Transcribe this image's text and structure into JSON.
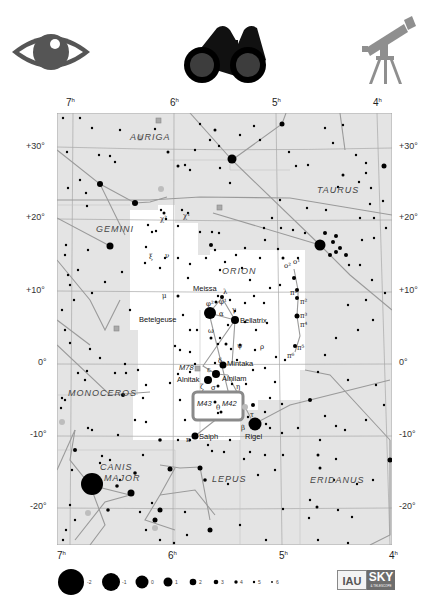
{
  "icons": {
    "eye": "eye-icon",
    "binoculars": "binoculars-icon",
    "telescope": "telescope-icon"
  },
  "ra_labels": [
    "7",
    "6",
    "5",
    "4"
  ],
  "ra_unit": "h",
  "dec_labels": [
    "+30°",
    "+20°",
    "+10°",
    "0°",
    "-10°",
    "-20°"
  ],
  "constellations": [
    "AURIGA",
    "TAURUS",
    "GEMINI",
    "ORION",
    "MONOCEROS",
    "CANIS",
    "MAJOR",
    "LEPUS",
    "ERIDANUS"
  ],
  "stars": {
    "betelgeuse": "Betelgeuse",
    "bellatrix": "Bellatrix",
    "meissa": "Meissa",
    "mintaka": "Mintaka",
    "alnitak": "Alnitak",
    "alnilam": "Alnilam",
    "saiph": "Saiph",
    "rigel": "Rigel"
  },
  "greek": {
    "alpha": "α",
    "gamma": "γ",
    "lambda": "λ",
    "phi1": "φ¹",
    "phi2": "φ²",
    "omega": "ω",
    "psi": "ψ",
    "rho": "ρ",
    "delta": "δ",
    "epsilon": "ε",
    "zeta": "ζ",
    "sigma": "σ",
    "iota": "ι",
    "eta": "η",
    "theta": "θ",
    "kappa": "κ",
    "beta": "β",
    "tau": "τ",
    "mu": "μ",
    "nu": "ν",
    "xi": "ξ",
    "chi1": "χ¹",
    "chi2": "χ²",
    "o1": "o¹",
    "o2": "o²",
    "pi1": "π¹",
    "pi2": "π²",
    "pi3": "π³",
    "pi4": "π⁴",
    "pi5": "π⁵",
    "pi6": "π⁶"
  },
  "deep_sky": {
    "m42": "M42",
    "m43": "M43",
    "m78": "M78"
  },
  "magnitude_legend": [
    "-2",
    "-1",
    "0",
    "1",
    "2",
    "3",
    "4",
    "5",
    "6"
  ],
  "logos": {
    "iau": "IAU",
    "sky": "SKY",
    "sky_sub": "& TELESCOPE"
  },
  "colors": {
    "sky_bg": "#e4e4e4",
    "constellation_area": "#ffffff",
    "lines": "#a0a0a0",
    "stars": "#000000",
    "nebula_box": "#8a8a8a",
    "icon_gray": "#555555",
    "telescope_gray": "#8f8f8f"
  }
}
